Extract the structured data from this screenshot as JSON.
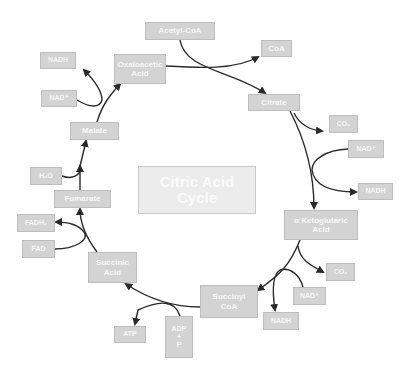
{
  "title": "Citric Acid\nCycle",
  "colors": {
    "box_fill": "#d3d3d3",
    "box_text": "#f7f7f7",
    "center_fill": "#ececec",
    "arrow": "#2a2a2a"
  },
  "nodes": {
    "acetyl_coa": "Acetyl-CoA",
    "coa": "CoA",
    "citrate": "Citrate",
    "co2_1": "CO₂",
    "nad_1": "NAD⁺",
    "nadh_1": "NADH",
    "alpha_ketoglutaric": "α Ketoglutaric\nAcid",
    "co2_2": "CO₂",
    "nad_2": "NAD⁺",
    "nadh_2": "NADH",
    "succinyl_coa": "Succinyl\nCoA",
    "adp_p": "ADP\n+\nP",
    "atp": "ATP",
    "succinic_acid": "Succinic\nAcid",
    "fad": "FAD",
    "fadh2": "FADH₂",
    "fumarate": "Fumarate",
    "h2o": "H₂O",
    "malate": "Malate",
    "nad_3": "NAD⁺",
    "nadh_3": "NADH",
    "oxaloacetic_acid": "Oxaloacetic\nAcid"
  }
}
